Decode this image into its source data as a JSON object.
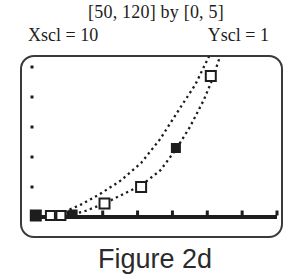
{
  "figure": {
    "window_label": "[50, 120] by [0, 5]",
    "xscl_label": "Xscl = 10",
    "yscl_label": "Yscl = 1",
    "caption": "Figure 2d"
  },
  "colors": {
    "ink": "#1d1d1d",
    "screen_border": "#3a3a3a",
    "background": "#ffffff"
  },
  "chart_data": {
    "type": "scatter",
    "title": "[50, 120] by [0, 5]",
    "xlabel": "",
    "ylabel": "",
    "window": {
      "xmin": 50,
      "xmax": 120,
      "ymin": 0,
      "ymax": 5,
      "xscl": 10,
      "yscl": 1
    },
    "x_ticks": [
      60,
      70,
      80,
      90,
      100,
      110,
      120
    ],
    "y_ticks": [
      1,
      2,
      3,
      4,
      5
    ],
    "grid": false,
    "legend": false,
    "points": [
      {
        "x": 50.8,
        "y": 0.05,
        "style": "filled",
        "size": 12
      },
      {
        "x": 55.0,
        "y": 0.05,
        "style": "open",
        "size": 9
      },
      {
        "x": 58.0,
        "y": 0.05,
        "style": "open",
        "size": 9
      },
      {
        "x": 61.5,
        "y": 0.1,
        "style": "filled",
        "size": 9
      },
      {
        "x": 70.5,
        "y": 0.45,
        "style": "open",
        "size": 10
      },
      {
        "x": 81.0,
        "y": 1.0,
        "style": "open",
        "size": 10
      },
      {
        "x": 91.0,
        "y": 2.3,
        "style": "filled",
        "size": 10
      },
      {
        "x": 101.0,
        "y": 4.7,
        "style": "open",
        "size": 10
      }
    ],
    "series": [
      {
        "name": "model-curve-upper",
        "style": "dotted",
        "points": [
          [
            57.5,
            0.1
          ],
          [
            63.5,
            0.4
          ],
          [
            69,
            0.75
          ],
          [
            75,
            1.2
          ],
          [
            81,
            1.8
          ],
          [
            86.5,
            2.6
          ],
          [
            92,
            3.6
          ],
          [
            96.5,
            4.4
          ],
          [
            99,
            5.0
          ],
          [
            100.5,
            5.35
          ]
        ]
      },
      {
        "name": "model-curve-lower",
        "style": "dotted",
        "points": [
          [
            60,
            0.05
          ],
          [
            65,
            0.2
          ],
          [
            70.5,
            0.45
          ],
          [
            76.5,
            0.8
          ],
          [
            81,
            1.05
          ],
          [
            86.5,
            1.55
          ],
          [
            91,
            2.25
          ],
          [
            95,
            3.0
          ],
          [
            99,
            3.9
          ],
          [
            101.5,
            4.6
          ],
          [
            103.5,
            5.3
          ]
        ]
      }
    ]
  }
}
